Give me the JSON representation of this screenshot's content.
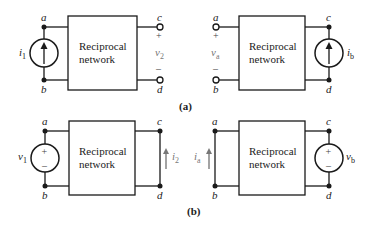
{
  "figure": {
    "network_label_line1": "Reciprocal",
    "network_label_line2": "network",
    "caption_a": "(a)",
    "caption_b": "(b)"
  },
  "panel_a_left": {
    "node_top_left": "a",
    "node_bottom_left": "b",
    "node_top_right": "c",
    "node_bottom_right": "d",
    "source_type": "current-source",
    "source_symbol": "i",
    "source_sub": "1",
    "output_symbol": "v",
    "output_sub": "2",
    "plus": "+",
    "minus": "–"
  },
  "panel_a_right": {
    "node_top_left": "a",
    "node_bottom_left": "b",
    "node_top_right": "c",
    "node_bottom_right": "d",
    "source_type": "current-source",
    "source_symbol": "i",
    "source_sub": "b",
    "output_symbol": "v",
    "output_sub": "a",
    "plus": "+",
    "minus": "–"
  },
  "panel_b_left": {
    "node_top_left": "a",
    "node_bottom_left": "b",
    "node_top_right": "c",
    "node_bottom_right": "d",
    "source_type": "voltage-source",
    "source_symbol": "v",
    "source_sub": "1",
    "output_symbol": "i",
    "output_sub": "2",
    "plus": "+",
    "minus": "–"
  },
  "panel_b_right": {
    "node_top_left": "a",
    "node_bottom_left": "b",
    "node_top_right": "c",
    "node_bottom_right": "d",
    "source_type": "voltage-source",
    "source_symbol": "v",
    "source_sub": "b",
    "output_symbol": "i",
    "output_sub": "a",
    "plus": "+",
    "minus": "–"
  }
}
